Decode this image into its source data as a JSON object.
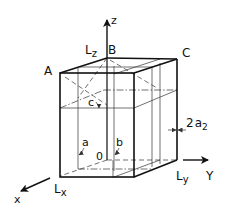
{
  "figure": {
    "axes": {
      "x_label": "x",
      "y_label": "Y",
      "z_label": "z"
    },
    "dimensions": {
      "lx": "L",
      "lx_sub": "x",
      "ly": "L",
      "ly_sub": "y",
      "lz": "L",
      "lz_sub": "z"
    },
    "points": {
      "a_corner": "A",
      "b_corner": "B",
      "c_corner": "C",
      "origin": "0"
    },
    "planes": {
      "a": "a",
      "b": "b",
      "c": "c"
    },
    "gap": {
      "prefix": "2",
      "var": "a",
      "sub": "2"
    },
    "colors": {
      "ink": "#111111",
      "background": "#ffffff"
    }
  }
}
